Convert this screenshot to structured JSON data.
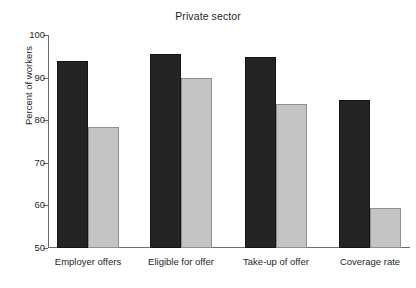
{
  "chart_data": {
    "type": "bar",
    "title": "Private sector",
    "xlabel": "",
    "ylabel": "Percent of workers",
    "categories": [
      "Employer offers",
      "Eligible for offer",
      "Take-up of offer",
      "Coverage rate"
    ],
    "series": [
      {
        "name": "series-dark",
        "color": "#242424",
        "values": [
          94.0,
          95.5,
          94.8,
          84.8
        ]
      },
      {
        "name": "series-light",
        "color": "#c4c4c4",
        "values": [
          78.5,
          90.0,
          83.8,
          59.3
        ]
      }
    ],
    "ylim": [
      50,
      100
    ],
    "yticks": [
      50,
      60,
      70,
      80,
      90,
      100
    ],
    "ytick_labels": [
      "50",
      "60",
      "70",
      "80",
      "90",
      "100"
    ],
    "grid": false,
    "legend": "none"
  },
  "colors": {
    "dark_bar": "#242424",
    "light_bar": "#c4c4c4",
    "axis": "#6d6d6d",
    "text": "#1f1f1f",
    "background": "#ffffff"
  }
}
